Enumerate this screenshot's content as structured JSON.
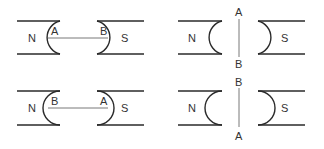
{
  "figure": {
    "panels": [
      {
        "id": "top-left",
        "north_label": "N",
        "south_label": "S",
        "wire_orientation": "horizontal",
        "wire_end_labels": [
          "A",
          "B"
        ]
      },
      {
        "id": "top-right",
        "north_label": "N",
        "south_label": "S",
        "wire_orientation": "vertical",
        "wire_end_labels": [
          "A",
          "B"
        ]
      },
      {
        "id": "bottom-left",
        "north_label": "N",
        "south_label": "S",
        "wire_orientation": "horizontal",
        "wire_end_labels": [
          "B",
          "A"
        ]
      },
      {
        "id": "bottom-right",
        "north_label": "N",
        "south_label": "S",
        "wire_orientation": "vertical",
        "wire_end_labels": [
          "B",
          "A"
        ]
      }
    ]
  }
}
